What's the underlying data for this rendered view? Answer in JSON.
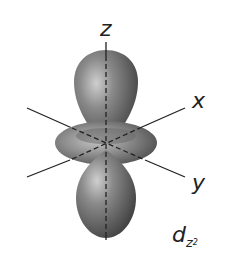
{
  "diagram": {
    "type": "atomic orbital",
    "axes": {
      "z": "z",
      "x": "x",
      "y": "y"
    },
    "orbital_label": {
      "main": "d",
      "subscript": "z",
      "superscript": "2"
    },
    "colors": {
      "lobe": "#7f7f7f",
      "lobe_highlight": "#c9c9c9",
      "lobe_shadow": "#3e3e3e",
      "axis": "#222222",
      "background": "#ffffff"
    }
  }
}
